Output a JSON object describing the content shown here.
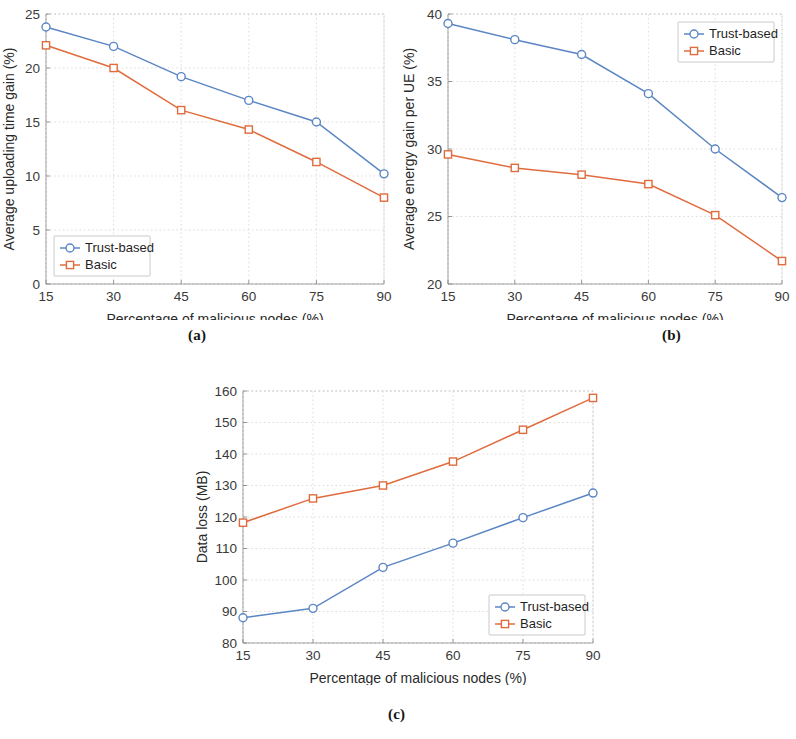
{
  "figure": {
    "captions": {
      "a": "(a)",
      "b": "(b)",
      "c": "(c)"
    },
    "shared_xlabel": "Percentage of malicious nodes (%)",
    "shared_xticks": [
      15,
      30,
      45,
      60,
      75,
      90
    ],
    "series_names": {
      "trust": "Trust-based",
      "basic": "Basic"
    },
    "colors": {
      "trust": "#5b86c4",
      "basic": "#e06c3e",
      "grid": "#d0d0d0",
      "axis": "#9a9a9a",
      "text": "#2a2a2a",
      "background": "#ffffff"
    }
  },
  "chart_data": [
    {
      "id": "a",
      "type": "line",
      "title": "",
      "xlabel": "Percentage of malicious nodes (%)",
      "ylabel": "Average uploading time gain (%)",
      "x": [
        15,
        30,
        45,
        60,
        75,
        90
      ],
      "xlim": [
        15,
        90
      ],
      "ylim": [
        0,
        25
      ],
      "xticks": [
        15,
        30,
        45,
        60,
        75,
        90
      ],
      "yticks": [
        0,
        5,
        10,
        15,
        20,
        25
      ],
      "grid": true,
      "legend_position": "bottom-left",
      "series": [
        {
          "name": "Trust-based",
          "marker": "circle",
          "color": "#5b86c4",
          "values": [
            23.8,
            22.0,
            19.2,
            17.0,
            15.0,
            10.2
          ]
        },
        {
          "name": "Basic",
          "marker": "square",
          "color": "#e06c3e",
          "values": [
            22.1,
            20.0,
            16.1,
            14.3,
            11.3,
            8.0
          ]
        }
      ]
    },
    {
      "id": "b",
      "type": "line",
      "title": "",
      "xlabel": "Percentage of malicious nodes (%)",
      "ylabel": "Average energy gain per UE (%)",
      "x": [
        15,
        30,
        45,
        60,
        75,
        90
      ],
      "xlim": [
        15,
        90
      ],
      "ylim": [
        20,
        40
      ],
      "xticks": [
        15,
        30,
        45,
        60,
        75,
        90
      ],
      "yticks": [
        20,
        25,
        30,
        35,
        40
      ],
      "grid": true,
      "legend_position": "top-right",
      "series": [
        {
          "name": "Trust-based",
          "marker": "circle",
          "color": "#5b86c4",
          "values": [
            39.3,
            38.1,
            37.0,
            34.1,
            30.0,
            26.4
          ]
        },
        {
          "name": "Basic",
          "marker": "square",
          "color": "#e06c3e",
          "values": [
            29.6,
            28.6,
            28.1,
            27.4,
            25.1,
            21.7
          ]
        }
      ]
    },
    {
      "id": "c",
      "type": "line",
      "title": "",
      "xlabel": "Percentage of malicious nodes (%)",
      "ylabel": "Data loss (MB)",
      "x": [
        15,
        30,
        45,
        60,
        75,
        90
      ],
      "xlim": [
        15,
        90
      ],
      "ylim": [
        80,
        160
      ],
      "xticks": [
        15,
        30,
        45,
        60,
        75,
        90
      ],
      "yticks": [
        80,
        90,
        100,
        110,
        120,
        130,
        140,
        150,
        160
      ],
      "grid": true,
      "legend_position": "bottom-right",
      "series": [
        {
          "name": "Trust-based",
          "marker": "circle",
          "color": "#5b86c4",
          "values": [
            88.0,
            91.0,
            104.0,
            111.7,
            119.8,
            127.6
          ]
        },
        {
          "name": "Basic",
          "marker": "square",
          "color": "#e06c3e",
          "values": [
            118.2,
            125.9,
            130.0,
            137.6,
            147.7,
            157.8
          ]
        }
      ]
    }
  ]
}
